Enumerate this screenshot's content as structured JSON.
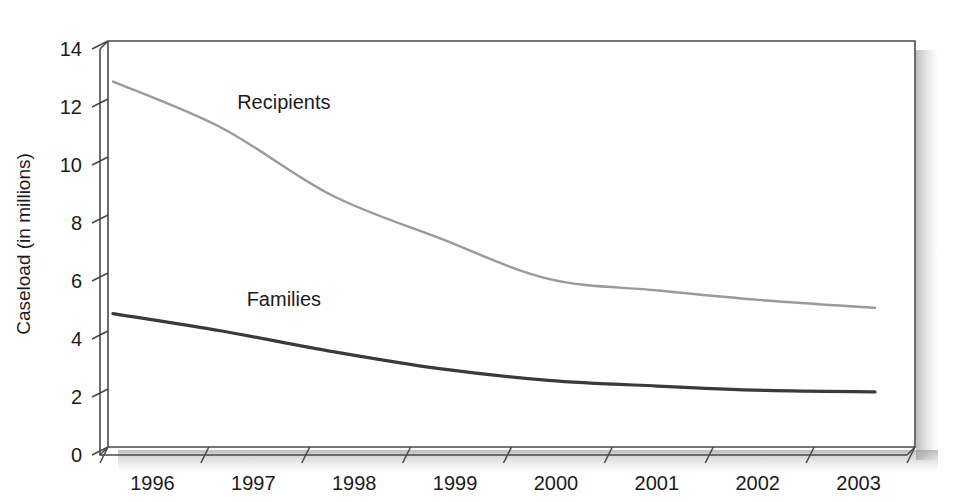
{
  "chart_data": {
    "type": "line",
    "title": "",
    "subtitle": "",
    "xlabel": "",
    "ylabel": "Caseload (in millions)",
    "x": [
      "1996",
      "1997",
      "1998",
      "1999",
      "2000",
      "2001",
      "2002",
      "2003"
    ],
    "categories": [
      "1996",
      "1997",
      "1998",
      "1999",
      "2000",
      "2001",
      "2002",
      "2003"
    ],
    "series": [
      {
        "name": "Recipients",
        "color": "#9a9a9a",
        "values": [
          12.6,
          11.0,
          8.7,
          7.2,
          5.8,
          5.4,
          5.05,
          4.8
        ]
      },
      {
        "name": "Families",
        "color": "#3a3a3a",
        "values": [
          4.6,
          4.0,
          3.3,
          2.7,
          2.3,
          2.1,
          1.95,
          1.9
        ]
      }
    ],
    "ylim": [
      0,
      14
    ],
    "ytick_values": [
      0,
      2,
      4,
      6,
      8,
      10,
      12,
      14
    ],
    "ytick_labels": [
      "0",
      "2",
      "4",
      "6",
      "8",
      "10",
      "12",
      "14"
    ],
    "xtick_labels": [
      "1996",
      "1997",
      "1998",
      "1999",
      "2000",
      "2001",
      "2002",
      "2003"
    ],
    "grid": false,
    "legend": "inline-annotations",
    "annotations": [
      {
        "text": "Recipients",
        "x": "1997",
        "y": 11.9
      },
      {
        "text": "Families",
        "x": "1997",
        "y": 5.1
      }
    ],
    "style": {
      "frame": "3d-box",
      "background": "#ffffff",
      "frame_color": "#4a4a4a",
      "shadow": true
    }
  }
}
